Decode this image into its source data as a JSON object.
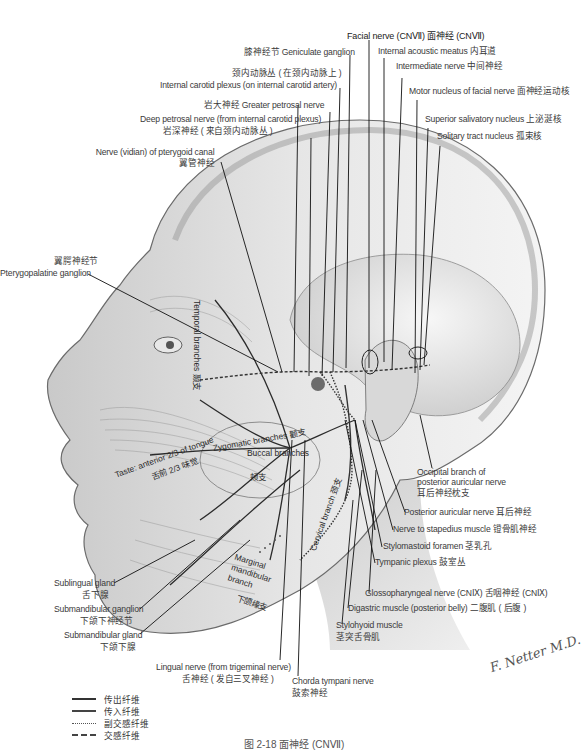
{
  "figure": {
    "caption": "图 2-18   面神经 (CNⅦ)",
    "signature": "F. Netter M.D."
  },
  "labels": {
    "facial_nerve": "Facial nerve (CNⅦ) 面神经 (CNⅦ)",
    "geniculate_ganglion": "膝神经节 Geniculate ganglion",
    "internal_acoustic_meatus": "Internal acoustic meatus 内耳道",
    "intermediate_nerve": "Intermediate nerve 中间神经",
    "internal_carotid_plexus_zh": "颈内动脉丛 ( 在颈内动脉上 )",
    "internal_carotid_plexus_en": "Internal carotid plexus (on internal carotid artery)",
    "motor_nucleus": "Motor nucleus of facial nerve 面神经运动核",
    "greater_petrosal": "岩大神经 Greater petrosal nerve",
    "deep_petrosal_en": "Deep petrosal nerve (from internal carotid plexus)",
    "deep_petrosal_zh": "岩深神经 ( 来自颈内动脉丛 )",
    "superior_salivatory": "Superior salivatory nucleus 上泌涎核",
    "solitary_tract": "Solitary tract nucleus 孤束核",
    "vidian_en": "Nerve (vidian) of pterygoid canal",
    "vidian_zh": "翼管神经",
    "pterygopalatine_zh": "翼腭神经节",
    "pterygopalatine_en": "Pterygopalatine ganglion",
    "temporal_branches": "Temporal branches 颞支",
    "zygomatic_branches": "Zygomatic branches 颧支",
    "taste_en": "Taste: anterior 2/3 of tongue",
    "taste_zh": "舌前 2/3 味觉",
    "buccal_en": "Buccal branches",
    "buccal_zh": "颊支",
    "cervical_branch": "Cervical branch 颈支",
    "marginal_en": "Marginal mandibular branch",
    "marginal_zh": "下颌缘支",
    "occipital_en_1": "Occipital branch of",
    "occipital_en_2": "posterior auricular nerve",
    "occipital_zh": "耳后神经枕支",
    "posterior_auricular": "Posterior auricular nerve 耳后神经",
    "nerve_to_stapedius": "Nerve to stapedius muscle 镫骨肌神经",
    "stylomastoid_foramen": "Stylomastoid foramen 茎乳孔",
    "tympanic_plexus": "Tympanic plexus 鼓室丛",
    "glossopharyngeal": "Glossopharyngeal nerve (CNⅨ) 舌咽神经 (CNⅨ)",
    "digastric": "Digastric muscle (posterior belly) 二腹肌 ( 后腹 )",
    "stylohyoid_en": "Stylohyoid muscle",
    "stylohyoid_zh": "茎突舌骨肌",
    "sublingual_en": "Sublingual gland",
    "sublingual_zh": "舌下腺",
    "submandibular_ganglion_en": "Submandibular ganglion",
    "submandibular_ganglion_zh": "下颌下神经节",
    "submandibular_gland_en": "Submandibular gland",
    "submandibular_gland_zh": "下颌下腺",
    "lingual_en": "Lingual nerve (from trigeminal nerve)",
    "lingual_zh": "舌神经 ( 发自三叉神经 )",
    "chorda_en": "Chorda tympani nerve",
    "chorda_zh": "鼓索神经"
  },
  "legend": [
    {
      "key": "efferent",
      "label": "传出纤维",
      "style": "solid"
    },
    {
      "key": "afferent",
      "label": "传入纤维",
      "style": "solid-thick"
    },
    {
      "key": "parasympathetic",
      "label": "副交感纤维",
      "style": "dotted"
    },
    {
      "key": "sympathetic",
      "label": "交感纤维",
      "style": "dashed"
    }
  ],
  "colors": {
    "line": "#1a1a1a",
    "text": "#3a3a3a",
    "shade_dark": "#8a8a8a",
    "shade_light": "#d6d6d6"
  }
}
